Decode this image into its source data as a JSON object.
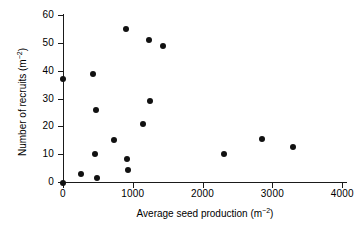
{
  "chart_data": {
    "type": "scatter",
    "title": "",
    "xlabel": "Average seed production (m⁻²)",
    "ylabel": "Number of recruits (m⁻²)",
    "xlabel_base": "Average seed production (m",
    "xlabel_exp": "−2",
    "xlabel_tail": ")",
    "ylabel_base": "Number of recruits (m",
    "ylabel_exp": "−2",
    "ylabel_tail": ")",
    "xlim": [
      0,
      4000
    ],
    "ylim": [
      0,
      60
    ],
    "xticks": [
      0,
      1000,
      2000,
      3000,
      4000
    ],
    "yticks": [
      0,
      10,
      20,
      30,
      40,
      50,
      60
    ],
    "xticklabels": [
      "0",
      "1000",
      "2000",
      "3000",
      "4000"
    ],
    "yticklabels": [
      "0",
      "10",
      "20",
      "30",
      "40",
      "50",
      "60"
    ],
    "grid": false,
    "legend": "none",
    "marker": "filled-circle",
    "marker_color": "#111111",
    "points": [
      {
        "x": 0,
        "y": 37.0
      },
      {
        "x": 0,
        "y": -0.2
      },
      {
        "x": 258,
        "y": 2.8
      },
      {
        "x": 425,
        "y": 38.7
      },
      {
        "x": 458,
        "y": 10.1
      },
      {
        "x": 468,
        "y": 25.9
      },
      {
        "x": 482,
        "y": 1.6
      },
      {
        "x": 735,
        "y": 15.0
      },
      {
        "x": 898,
        "y": 55.2
      },
      {
        "x": 912,
        "y": 8.3
      },
      {
        "x": 927,
        "y": 4.2
      },
      {
        "x": 1150,
        "y": 20.8
      },
      {
        "x": 1232,
        "y": 51.2
      },
      {
        "x": 1246,
        "y": 29.2
      },
      {
        "x": 1437,
        "y": 48.9
      },
      {
        "x": 2311,
        "y": 10.0
      },
      {
        "x": 2855,
        "y": 15.4
      },
      {
        "x": 3291,
        "y": 12.6
      }
    ]
  }
}
